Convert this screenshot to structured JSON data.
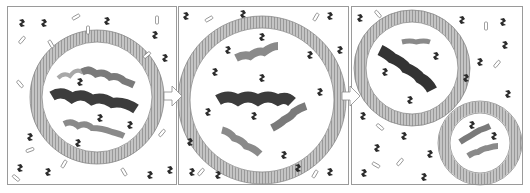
{
  "diagram": {
    "type": "vesicle-growth-and-division",
    "panels": [
      {
        "id": "panel-1",
        "state": "vesicle containing four helical strands",
        "x": 7,
        "width": 170
      },
      {
        "id": "panel-2",
        "state": "enlarged vesicle with four separated strands",
        "x": 178,
        "width": 171
      },
      {
        "id": "panel-3",
        "state": "two daughter vesicles after division",
        "x": 351,
        "width": 172
      }
    ],
    "arrows": [
      {
        "from": "panel-1",
        "to": "panel-2"
      },
      {
        "from": "panel-2",
        "to": "panel-3"
      }
    ],
    "colors": {
      "membrane": "#b8b8b8",
      "membrane_line": "#8a8a8a",
      "strand_dark": "#3c3c3c",
      "strand_mid": "#7a7a7a",
      "strand_light": "#a8a8a8",
      "monomer": "#2a2a2a",
      "border": "#9a9a9a"
    }
  }
}
